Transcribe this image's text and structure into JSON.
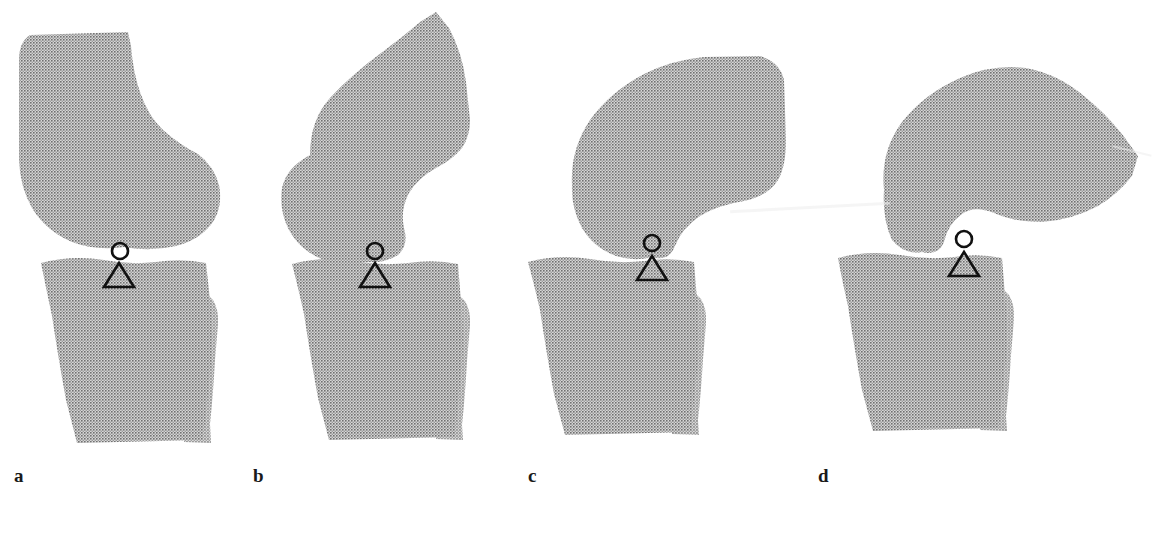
{
  "figure": {
    "kind": "anatomical-illustration",
    "background_color": "#ffffff",
    "bone_fill_color": "#a8a8a8",
    "bone_pattern": "halftone-checker",
    "marker_stroke_color": "#111111",
    "panel_count": 4
  },
  "panels": [
    {
      "id": "a",
      "label": "a",
      "label_x": 14,
      "label_y": 478,
      "flexion_stage": 1,
      "femur_name": "femur",
      "tibia_name": "tibia",
      "fibula_name": "fibula",
      "markers": {
        "circle": {
          "name": "femoral-contact-point",
          "cx": 120,
          "cy": 251,
          "r": 8
        },
        "triangle": {
          "name": "tibial-contact-point",
          "cx": 119,
          "cy": 275,
          "half_width": 15,
          "height": 24
        }
      }
    },
    {
      "id": "b",
      "label": "b",
      "label_x": 253,
      "label_y": 478,
      "flexion_stage": 2,
      "femur_name": "femur",
      "tibia_name": "tibia",
      "fibula_name": "fibula",
      "markers": {
        "circle": {
          "name": "femoral-contact-point",
          "cx": 375,
          "cy": 251,
          "r": 8
        },
        "triangle": {
          "name": "tibial-contact-point",
          "cx": 375,
          "cy": 275,
          "half_width": 15,
          "height": 24
        }
      }
    },
    {
      "id": "c",
      "label": "c",
      "label_x": 528,
      "label_y": 478,
      "flexion_stage": 3,
      "femur_name": "femur",
      "tibia_name": "tibia",
      "fibula_name": "fibula",
      "markers": {
        "circle": {
          "name": "femoral-contact-point",
          "cx": 652,
          "cy": 243,
          "r": 8
        },
        "triangle": {
          "name": "tibial-contact-point",
          "cx": 652,
          "cy": 268,
          "half_width": 15,
          "height": 24
        }
      }
    },
    {
      "id": "d",
      "label": "d",
      "label_x": 818,
      "label_y": 478,
      "flexion_stage": 4,
      "femur_name": "femur",
      "tibia_name": "tibia",
      "fibula_name": "fibula",
      "markers": {
        "circle": {
          "name": "femoral-contact-point",
          "cx": 964,
          "cy": 239,
          "r": 8
        },
        "triangle": {
          "name": "tibial-contact-point",
          "cx": 964,
          "cy": 264,
          "half_width": 15,
          "height": 24
        }
      }
    }
  ],
  "shapes": {
    "a": {
      "femur": "M 30,35 L 128,32 L 131,46 Q 133,72 140,92 Q 148,116 163,130 Q 180,145 198,154 Q 214,166 219,185 Q 223,206 213,222 Q 200,240 176,246 Q 150,252 124,247 Q 96,251 72,242 Q 46,231 32,208 Q 20,187 19,160 L 19,60 Q 19,42 30,35 Z",
      "tibia": "M 41,263 Q 72,255 104,260 Q 130,265 156,262 Q 182,258 206,263 L 210,300 Q 213,330 211,362 L 207,404 L 203,440 L 77,443 L 66,400 Q 58,356 52,316 Q 46,288 41,263 Z",
      "fibula": "M 196,290 Q 206,292 213,300 Q 219,310 218,324 L 215,360 Q 213,396 210,424 L 211,443 L 184,442 L 185,408 Q 184,372 188,336 Q 191,310 196,290 Z"
    },
    "b": {
      "femur": "M 310,155 Q 310,120 330,98 Q 352,74 385,50 Q 404,36 420,22 L 436,12 L 449,28 Q 462,52 466,82 L 470,120 Q 470,136 462,148 Q 452,160 436,168 Q 418,178 409,193 Q 400,210 404,228 Q 409,245 398,255 Q 384,264 362,262 Q 340,266 319,258 Q 298,248 288,228 Q 279,209 282,188 Q 286,168 310,155 Z",
      "tibia": "M 292,264 Q 322,256 354,261 Q 382,266 408,263 Q 434,259 458,264 L 461,302 Q 464,332 462,364 L 458,404 L 455,437 L 329,440 L 318,398 Q 310,354 304,314 Q 298,287 292,264 Z",
      "fibula": "M 448,291 Q 458,293 465,301 Q 471,311 470,325 L 467,361 Q 465,397 462,425 L 463,440 L 436,439 L 437,406 Q 436,370 440,334 Q 443,310 448,291 Z"
    },
    "c": {
      "femur": "M 572,185 Q 570,150 590,120 Q 610,92 644,74 Q 672,60 704,57 L 760,56 Q 780,62 784,80 L 786,140 Q 786,166 778,180 Q 768,196 744,201 Q 718,205 700,216 Q 682,228 675,246 Q 669,262 652,257 Q 634,262 616,256 Q 594,248 582,228 Q 571,208 572,185 Z",
      "tibia": "M 528,262 Q 558,254 590,259 Q 618,264 644,261 Q 670,257 694,262 L 697,300 Q 700,330 698,362 L 694,400 L 691,432 L 565,435 L 554,394 Q 546,350 540,310 Q 534,284 528,262 Z",
      "fibula": "M 684,289 Q 694,291 701,299 Q 707,309 706,323 L 703,359 Q 701,393 698,420 L 699,435 L 672,434 L 673,402 Q 672,366 676,330 Q 679,308 684,289 Z"
    },
    "d": {
      "femur": "M 884,190 Q 880,152 902,122 Q 924,94 960,78 Q 992,64 1026,68 Q 1058,74 1084,96 Q 1104,112 1122,134 L 1138,156 L 1132,176 Q 1118,194 1098,206 Q 1072,220 1042,222 Q 1014,222 994,213 Q 974,205 962,214 Q 948,224 944,242 Q 939,256 922,252 Q 904,255 892,240 Q 882,218 884,190 Z",
      "tibia": "M 838,258 Q 868,250 900,255 Q 928,260 954,257 Q 978,253 1002,258 L 1005,296 Q 1008,326 1006,358 L 1002,396 L 999,428 L 873,431 L 862,390 Q 854,346 848,306 Q 842,280 838,258 Z",
      "fibula": "M 992,285 Q 1002,287 1009,295 Q 1015,305 1014,319 L 1011,355 Q 1009,389 1006,416 L 1007,431 L 980,430 L 981,398 Q 980,362 984,326 Q 987,304 992,285 Z"
    }
  }
}
